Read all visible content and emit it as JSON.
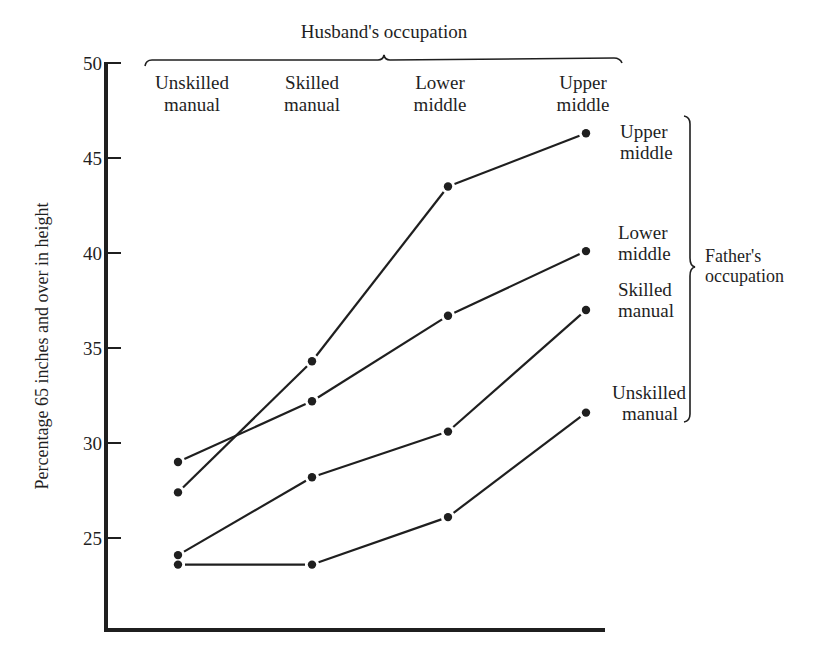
{
  "chart_data": {
    "type": "line",
    "title": "",
    "top_group_label": "Husband's occupation",
    "right_group_label": [
      "Father's",
      "occupation"
    ],
    "xlabel": "Husband's occupation",
    "ylabel": "Percentage 65 inches and over in height",
    "categories": [
      [
        "Unskilled",
        "manual"
      ],
      [
        "Skilled",
        "manual"
      ],
      [
        "Lower",
        "middle"
      ],
      [
        "Upper",
        "middle"
      ]
    ],
    "y_ticks": [
      25,
      30,
      35,
      40,
      45,
      50
    ],
    "ylim": [
      20.5,
      50
    ],
    "grid": false,
    "legend_position": "right (inline series labels with brace)",
    "series": [
      {
        "name": "Upper middle",
        "label_lines": [
          "Upper",
          "middle"
        ],
        "values": [
          27.4,
          34.3,
          43.5,
          46.3
        ]
      },
      {
        "name": "Lower middle",
        "label_lines": [
          "Lower",
          "middle"
        ],
        "values": [
          29.0,
          32.2,
          36.7,
          40.1
        ]
      },
      {
        "name": "Skilled manual",
        "label_lines": [
          "Skilled",
          "manual"
        ],
        "values": [
          24.1,
          28.2,
          30.6,
          37.0
        ]
      },
      {
        "name": "Unskilled manual",
        "label_lines": [
          "Unskilled",
          "manual"
        ],
        "values": [
          23.6,
          23.6,
          26.1,
          31.6
        ]
      }
    ],
    "colors": {
      "ink": "#1f1f1f",
      "background": "#ffffff"
    }
  }
}
